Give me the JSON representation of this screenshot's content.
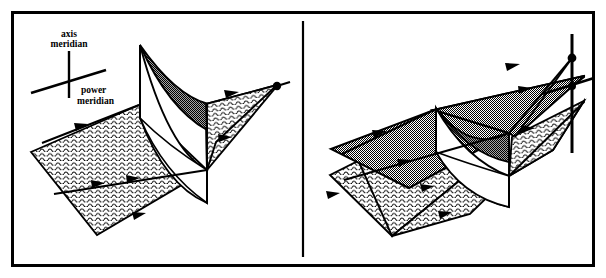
{
  "figure": {
    "name": "dioptric-power-meridian-surfaces",
    "background_color": "#ffffff",
    "ink_color": "#000000",
    "frame": {
      "border_color": "#000000",
      "border_width_px": 3,
      "x": 11,
      "y": 11,
      "width": 584,
      "height": 256
    },
    "divider": {
      "name": "panel-divider",
      "x": 303,
      "y_top": 20,
      "y_bottom": 258,
      "color": "#000000",
      "width_px": 2
    }
  },
  "legend": {
    "name": "meridian-legend",
    "axis_meridian_label_line1": "axis",
    "axis_meridian_label_line2": "meridian",
    "power_meridian_label_line1": "power",
    "power_meridian_label_line2": "meridian",
    "axis_meridian_orientation": "vertical",
    "power_meridian_orientation": "diagonal-lower-left-to-upper-right",
    "line_color": "#000000"
  },
  "panels": [
    {
      "id": "left-panel",
      "name": "panel-left",
      "description": "Single wavy-hatched plane folded with a white saddle surface and a gray stippled crescent lobe",
      "surfaces": [
        {
          "name": "wavy-plane-lower",
          "fill": "wavy",
          "fill_color": "#ffffff"
        },
        {
          "name": "wavy-plane-right-wing",
          "fill": "wavy",
          "fill_color": "#ffffff"
        },
        {
          "name": "saddle-upper-lobe",
          "fill": "stipple",
          "fill_color": "#9a9a9a"
        },
        {
          "name": "saddle-lower-lobe",
          "fill": "solid",
          "fill_color": "#ffffff"
        }
      ],
      "arrow_count": 5,
      "node_count": 1
    },
    {
      "id": "right-panel",
      "name": "panel-right",
      "description": "Gray stippled plane above a wavy-hatched plane, folded with a saddle surface, plus axis and power meridian reference lines with nodes",
      "surfaces": [
        {
          "name": "gray-plane-upper",
          "fill": "stipple",
          "fill_color": "#b4b4b4"
        },
        {
          "name": "gray-plane-right-wing",
          "fill": "stipple",
          "fill_color": "#b4b4b4"
        },
        {
          "name": "wavy-plane-lower",
          "fill": "wavy",
          "fill_color": "#ffffff"
        },
        {
          "name": "wavy-plane-right-wing",
          "fill": "wavy",
          "fill_color": "#ffffff"
        },
        {
          "name": "saddle-upper-lobe",
          "fill": "stipple",
          "fill_color": "#9a9a9a"
        },
        {
          "name": "saddle-lower-lobe",
          "fill": "solid",
          "fill_color": "#ffffff"
        }
      ],
      "axis_line": {
        "name": "axis-meridian-reference-line",
        "orientation": "vertical"
      },
      "power_line": {
        "name": "power-meridian-reference-line",
        "orientation": "diagonal"
      },
      "arrow_count": 8,
      "node_count": 2
    }
  ],
  "colors": {
    "ink": "#000000",
    "paper": "#ffffff",
    "stipple_light": "#b4b4b4",
    "stipple_dark": "#9a9a9a"
  }
}
